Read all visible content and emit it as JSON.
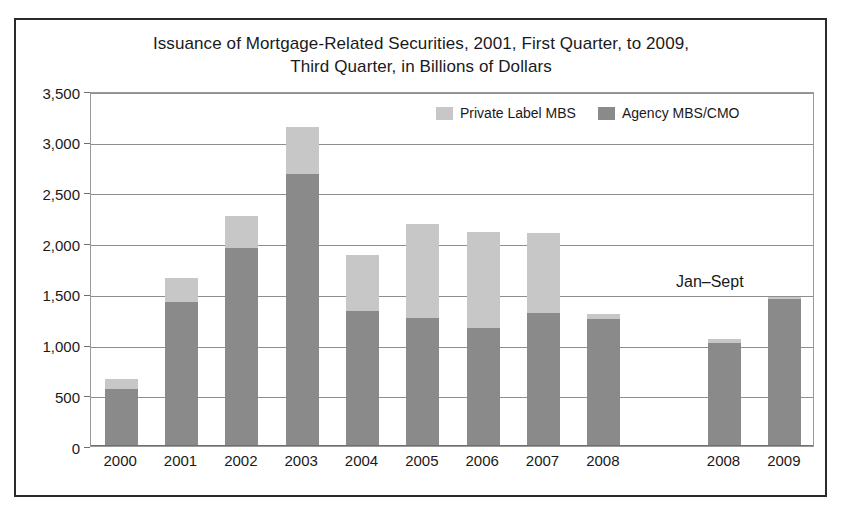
{
  "figure": {
    "title_line1": "Issuance of Mortgage-Related Securities, 2001, First Quarter, to 2009,",
    "title_line2": "Third Quarter, in Billions of Dollars",
    "annotation": "Jan–Sept",
    "border_color": "#2b2b2b"
  },
  "legend": {
    "position": "top-right-inside",
    "items": [
      {
        "label": "Private Label MBS",
        "color": "#c7c7c7",
        "swatch_name": "legend-swatch-private-label"
      },
      {
        "label": "Agency MBS/CMO",
        "color": "#8a8a8a",
        "swatch_name": "legend-swatch-agency"
      }
    ]
  },
  "chart_data": {
    "type": "bar",
    "subtype": "stacked",
    "title": "Issuance of Mortgage-Related Securities, 2001, First Quarter, to 2009, Third Quarter, in Billions of Dollars",
    "xlabel": "",
    "ylabel": "",
    "ylim": [
      0,
      3500
    ],
    "ytick_values": [
      0,
      500,
      1000,
      1500,
      2000,
      2500,
      3000,
      3500
    ],
    "ytick_labels": [
      "0",
      "500",
      "1,000",
      "1,500",
      "2,000",
      "2,500",
      "3,000",
      "3,500"
    ],
    "grid": true,
    "grid_axis": "y",
    "categories": [
      "2000",
      "2001",
      "2002",
      "2003",
      "2004",
      "2005",
      "2006",
      "2007",
      "2008",
      "",
      "2008",
      "2009"
    ],
    "gap_after_index": 8,
    "series": [
      {
        "name": "Agency MBS/CMO",
        "color": "#8a8a8a",
        "values": [
          565,
          1420,
          1950,
          2680,
          1330,
          1260,
          1160,
          1310,
          1250,
          null,
          1020,
          1450
        ]
      },
      {
        "name": "Private Label MBS",
        "color": "#c7c7c7",
        "values": [
          100,
          240,
          320,
          470,
          550,
          930,
          950,
          790,
          50,
          null,
          40,
          15
        ]
      }
    ],
    "totals": [
      665,
      1660,
      2270,
      3150,
      1880,
      2190,
      2110,
      2100,
      1300,
      null,
      1060,
      1465
    ],
    "annotations": [
      {
        "text": "Jan–Sept",
        "applies_to": [
          "2008",
          "2009"
        ],
        "note": "last two bars are January through September"
      }
    ]
  }
}
